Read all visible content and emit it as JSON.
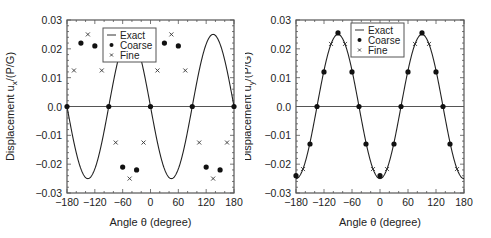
{
  "chart_data": [
    {
      "type": "line",
      "title": "",
      "xlabel": "Angle θ (degree)",
      "ylabel": "Displacement u_x/(P/G)",
      "ylabel_main": "Displacement u",
      "ylabel_sub": "x",
      "ylabel_tail": "/(P/G)",
      "xlim": [
        -180,
        180
      ],
      "ylim": [
        -0.03,
        0.03
      ],
      "xticks": [
        -180,
        -120,
        -60,
        0,
        60,
        120,
        180
      ],
      "xtick_labels": [
        "−180",
        "−120",
        "−60",
        "0",
        "60",
        "120",
        "180"
      ],
      "yticks": [
        0.03,
        0.02,
        0.01,
        0.0,
        -0.01,
        -0.02,
        -0.03
      ],
      "ytick_labels": [
        "0.03",
        "0.02",
        "0.01",
        "0.0",
        "−0.01",
        "−0.02",
        "−0.03"
      ],
      "grid": false,
      "zero_line": true,
      "legend": {
        "position": "upper-center",
        "entries": [
          "Exact",
          "Coarse",
          "Fine"
        ]
      },
      "series": [
        {
          "name": "Exact",
          "style": "line",
          "formula": "-0.025*sin(2θ)"
        },
        {
          "name": "Coarse",
          "style": "dot",
          "x": [
            -180,
            -150,
            -120,
            -90,
            -60,
            -30,
            0,
            30,
            60,
            90,
            120,
            150,
            180
          ],
          "y": [
            0,
            0.022,
            0.021,
            0,
            -0.021,
            -0.022,
            0,
            0.022,
            0.021,
            0,
            -0.021,
            -0.022,
            0
          ]
        },
        {
          "name": "Fine",
          "style": "x",
          "x": [
            -165,
            -135,
            -105,
            -75,
            -45,
            -15,
            15,
            45,
            75,
            105,
            135,
            165
          ],
          "y": [
            0.0125,
            0.025,
            0.0125,
            -0.0125,
            -0.025,
            -0.0125,
            0.0125,
            0.025,
            0.0125,
            -0.0125,
            -0.025,
            -0.0125
          ]
        }
      ]
    },
    {
      "type": "line",
      "title": "",
      "xlabel": "Angle θ (degree)",
      "ylabel": "Displacement u_y/(P/G)",
      "ylabel_main": "Displacement u",
      "ylabel_sub": "y",
      "ylabel_tail": "/(P/G)",
      "xlim": [
        -180,
        180
      ],
      "ylim": [
        -0.03,
        0.03
      ],
      "xticks": [
        -180,
        -120,
        -60,
        0,
        60,
        120,
        180
      ],
      "xtick_labels": [
        "−180",
        "−120",
        "−60",
        "0",
        "60",
        "120",
        "180"
      ],
      "yticks": [
        0.03,
        0.02,
        0.01,
        0.0,
        -0.01,
        -0.02,
        -0.03
      ],
      "ytick_labels": [
        "0.03",
        "0.02",
        "0.01",
        "0.0",
        "−0.01",
        "−0.02",
        "−0.03"
      ],
      "grid": false,
      "zero_line": true,
      "legend": {
        "position": "upper-center",
        "entries": [
          "Exact",
          "Coarse",
          "Fine"
        ]
      },
      "series": [
        {
          "name": "Exact",
          "style": "line",
          "formula": "-0.025*cos(2θ)"
        },
        {
          "name": "Coarse",
          "style": "dot",
          "x": [
            -180,
            -150,
            -135,
            -120,
            -90,
            -60,
            -45,
            -30,
            0,
            30,
            45,
            60,
            90,
            120,
            135,
            150
          ],
          "y": [
            -0.024,
            -0.013,
            0,
            0.012,
            0.0255,
            0.012,
            0,
            -0.013,
            -0.024,
            -0.013,
            0,
            0.012,
            0.0255,
            0.012,
            0,
            -0.013
          ]
        },
        {
          "name": "Fine",
          "style": "x",
          "x": [
            -165,
            -105,
            -75,
            -15,
            15,
            75,
            105,
            165
          ],
          "y": [
            -0.0217,
            0.0217,
            0.0217,
            -0.0217,
            -0.0217,
            0.0217,
            0.0217,
            -0.0217
          ]
        }
      ]
    }
  ]
}
